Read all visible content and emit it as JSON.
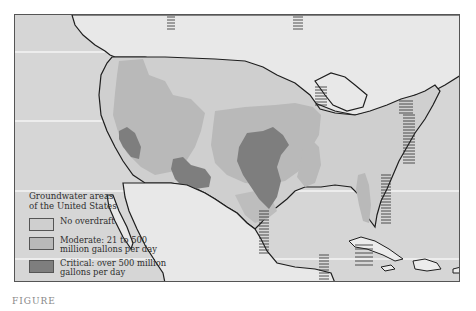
{
  "figure": {
    "caption": "FIGURE"
  },
  "legend": {
    "title_line1": "Groundwater areas",
    "title_line2": "of the United States",
    "items": [
      {
        "label_line1": "No overdraft",
        "label_line2": "",
        "color": "#cfcfcf"
      },
      {
        "label_line1": "Moderate: 21 to 500",
        "label_line2": "million gallons per day",
        "color": "#b9b9b9"
      },
      {
        "label_line1": "Critical: over 500 million",
        "label_line2": "gallons per day",
        "color": "#7e7e7e"
      }
    ]
  },
  "colors": {
    "background": "#dcdcdc",
    "land_canada_mexico": "#e6e6e6",
    "no_overdraft": "#cfcfcf",
    "moderate": "#b9b9b9",
    "critical": "#7e7e7e",
    "coastline": "#1e1e1e",
    "ocean": "#d8d8d8"
  }
}
